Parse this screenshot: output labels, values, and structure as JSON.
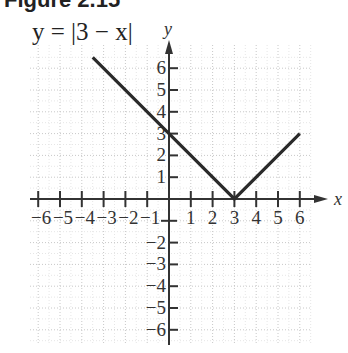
{
  "figure": {
    "title": "Figure 2.15",
    "equation": "y = |3 − x|"
  },
  "chart_data": {
    "type": "line",
    "title": "y = |3 − x|",
    "xlabel": "x",
    "ylabel": "y",
    "xlim": [
      -6,
      6
    ],
    "ylim": [
      -6,
      6
    ],
    "grid": true,
    "xticks": [
      -6,
      -5,
      -4,
      -3,
      -2,
      -1,
      1,
      2,
      3,
      4,
      5,
      6
    ],
    "yticks": [
      -6,
      -5,
      -4,
      -3,
      -2,
      1,
      2,
      3,
      4,
      5,
      6
    ],
    "series": [
      {
        "name": "y = |3 − x|",
        "x": [
          -3.5,
          0,
          3,
          6
        ],
        "y": [
          6.5,
          3,
          0,
          3
        ]
      }
    ],
    "annotations": [
      "vertex at (3, 0)",
      "y-intercept at (0, 3)"
    ]
  }
}
